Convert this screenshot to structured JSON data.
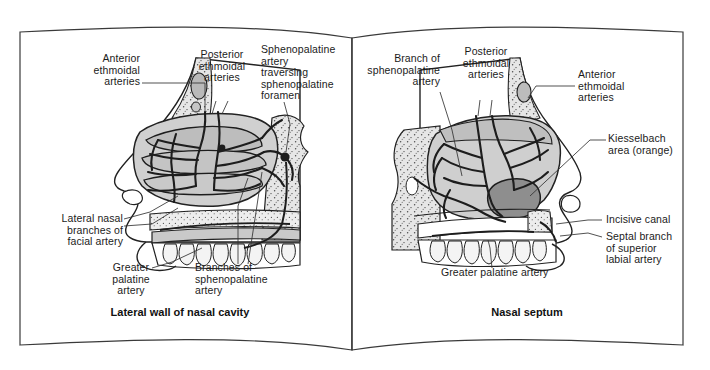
{
  "figure": {
    "kind": "anatomy-illustration",
    "medium": "open book spread, grayscale line art",
    "background_color": "#ffffff",
    "ink_color": "#1b1b1b",
    "page_outline_color": "#3a3a3a"
  },
  "left_page": {
    "caption": "Lateral wall of nasal cavity",
    "labels": [
      {
        "id": "anterior-ethmoidal-arteries",
        "text": "Anterior\nethmoidal\narteries",
        "align": "right"
      },
      {
        "id": "posterior-ethmoidal-arteries",
        "text": "Posterior\nethmoidal\narteries",
        "align": "center"
      },
      {
        "id": "sphenopalatine-artery-foramen",
        "text": "Sphenopalatine\nartery\ntraversing\nsphenopalatine\nforamen",
        "align": "left"
      },
      {
        "id": "lateral-nasal-branches-facial-artery",
        "text": "Lateral nasal\nbranches of\nfacial artery",
        "align": "right"
      },
      {
        "id": "greater-palatine-artery",
        "text": "Greater\npalatine\nartery",
        "align": "center"
      },
      {
        "id": "branches-of-sphenopalatine-artery",
        "text": "Branches of\nsphenopalatine\nartery",
        "align": "left"
      }
    ]
  },
  "right_page": {
    "caption": "Nasal septum",
    "labels": [
      {
        "id": "branch-of-sphenopalatine-artery",
        "text": "Branch of\nsphenopalatine\nartery",
        "align": "right"
      },
      {
        "id": "posterior-ethmoidal-arteries",
        "text": "Posterior\nethmoidal\narteries",
        "align": "center"
      },
      {
        "id": "anterior-ethmoidal-arteries",
        "text": "Anterior\nethmoidal\narteries",
        "align": "left"
      },
      {
        "id": "kiesselbach-area",
        "text": "Kiesselbach\narea (orange)",
        "align": "left"
      },
      {
        "id": "incisive-canal",
        "text": "Incisive canal",
        "align": "left"
      },
      {
        "id": "septal-branch-superior-labial-artery",
        "text": "Septal branch\nof superior\nlabial artery",
        "align": "left"
      },
      {
        "id": "greater-palatine-artery",
        "text": "Greater palatine artery",
        "align": "left"
      }
    ]
  },
  "palette": {
    "paper": "#ffffff",
    "tissue_light": "#d2d2d2",
    "tissue_mid": "#b8b8b8",
    "tissue_dark": "#9a9a9a",
    "kiesselbach": "#8e8e8e",
    "vessel": "#1d1d1d",
    "bone_stipple": "#cfcfcf",
    "outline": "#222222"
  }
}
